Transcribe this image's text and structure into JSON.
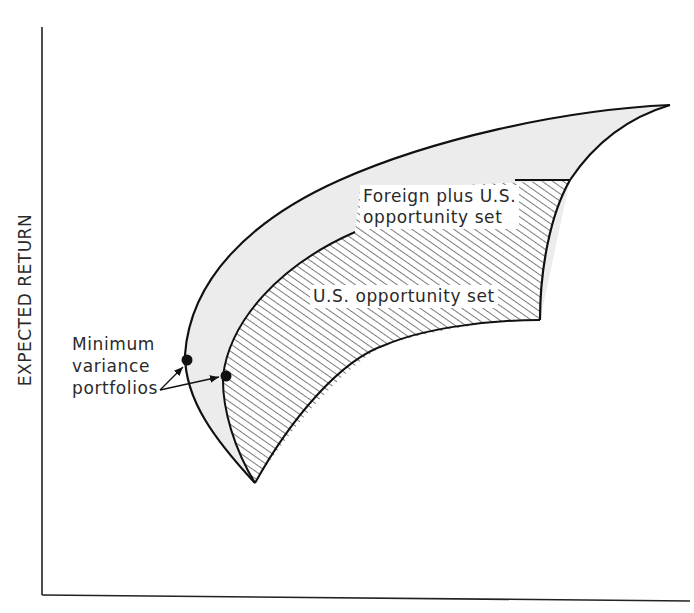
{
  "figure": {
    "type": "diagram",
    "y_axis_label": "EXPECTED RETURN",
    "x_axis_label": "",
    "regions": [
      {
        "name": "Foreign plus U.S. opportunity set",
        "fill": "#ececec",
        "pattern": "solid light gray"
      },
      {
        "name": "U.S. opportunity set",
        "fill": "#ffffff",
        "pattern": "diagonal hatch"
      }
    ],
    "labels": {
      "foreign_line1": "Foreign plus U.S.",
      "foreign_line2": "opportunity set",
      "us_set": "U.S. opportunity set",
      "minvar_line1": "Minimum",
      "minvar_line2": "variance",
      "minvar_line3": "portfolios"
    },
    "points": [
      {
        "name": "min-variance foreign plus U.S.",
        "x": 187,
        "y": 360
      },
      {
        "name": "min-variance U.S.",
        "x": 226,
        "y": 376
      }
    ],
    "colors": {
      "line": "#111111",
      "shade": "#ececec",
      "hatch": "#444444",
      "text": "#2a2a2a"
    }
  }
}
